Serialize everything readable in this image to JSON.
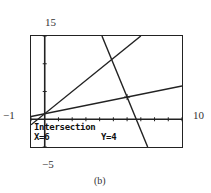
{
  "labels": {
    "ymax": "15",
    "ymin": "−5",
    "xmin": "−1",
    "xmax": "10",
    "caption": "(b)"
  },
  "screen": {
    "title": "Intersection",
    "x_readout": "X=6",
    "y_readout": "Y=4"
  },
  "chart_data": {
    "type": "line",
    "title": "Intersection",
    "xlim": [
      -1,
      10
    ],
    "ylim": [
      -5,
      15
    ],
    "x_scale": 1,
    "y_scale": 5,
    "series": [
      {
        "name": "line 1",
        "x": [
          -1,
          7
        ],
        "y": [
          -1,
          15
        ]
      },
      {
        "name": "line 2",
        "x": [
          -1,
          10
        ],
        "y": [
          0.5,
          6
        ]
      },
      {
        "name": "line 3",
        "x": [
          4.17,
          7.5
        ],
        "y": [
          15,
          -5
        ]
      }
    ],
    "intersection": {
      "x": 6,
      "y": 4
    },
    "caption": "(b)"
  }
}
